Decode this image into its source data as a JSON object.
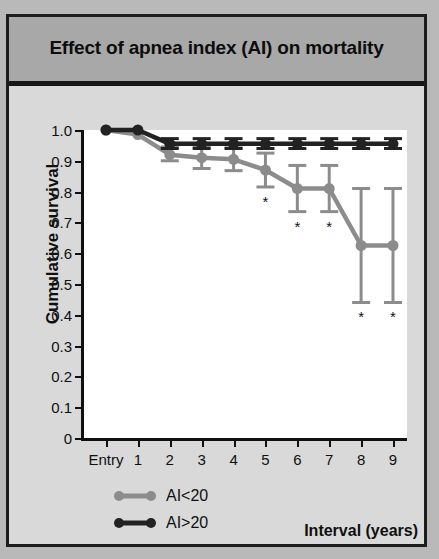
{
  "figure": {
    "title": "Effect of apnea index (AI) on mortality"
  },
  "chart_data": {
    "type": "line",
    "title": "Effect of apnea index (AI) on mortality",
    "xlabel": "Interval (years)",
    "ylabel": "Cumulative survival",
    "categories": [
      "Entry",
      "1",
      "2",
      "3",
      "4",
      "5",
      "6",
      "7",
      "8",
      "9"
    ],
    "ylim": [
      0,
      1.0
    ],
    "yticks": [
      0,
      0.1,
      0.2,
      0.3,
      0.4,
      0.5,
      0.6,
      0.7,
      0.8,
      0.9,
      1.0
    ],
    "ytick_labels": [
      "0",
      "0.1",
      "0.2",
      "0.3",
      "0.4",
      "0.5",
      "0.6",
      "0.7",
      "0.8",
      "0.9",
      "1.0"
    ],
    "grid": false,
    "legend_position": "below-left",
    "series": [
      {
        "name": "AI<20",
        "color": "#8c8c8c",
        "values": [
          1.0,
          0.985,
          0.92,
          0.91,
          0.905,
          0.87,
          0.81,
          0.81,
          0.625,
          0.625
        ],
        "err_low": [
          1.0,
          0.985,
          0.9,
          0.875,
          0.868,
          0.815,
          0.735,
          0.735,
          0.44,
          0.44
        ],
        "err_high": [
          1.0,
          0.985,
          0.945,
          0.945,
          0.942,
          0.925,
          0.885,
          0.885,
          0.81,
          0.81
        ],
        "significance": [
          false,
          false,
          false,
          false,
          false,
          true,
          true,
          true,
          true,
          true
        ]
      },
      {
        "name": "AI>20",
        "color": "#222222",
        "values": [
          1.0,
          1.0,
          0.955,
          0.955,
          0.955,
          0.955,
          0.955,
          0.955,
          0.955,
          0.955
        ],
        "err_low": [
          1.0,
          1.0,
          0.94,
          0.94,
          0.94,
          0.94,
          0.94,
          0.94,
          0.94,
          0.94
        ],
        "err_high": [
          1.0,
          1.0,
          0.972,
          0.972,
          0.972,
          0.972,
          0.972,
          0.972,
          0.972,
          0.972
        ],
        "significance": [
          false,
          false,
          false,
          false,
          false,
          false,
          false,
          false,
          false,
          false
        ]
      }
    ],
    "annotation_symbol": "*"
  },
  "legend": {
    "items": [
      {
        "label": "AI<20",
        "color": "#8c8c8c"
      },
      {
        "label": "AI>20",
        "color": "#222222"
      }
    ]
  }
}
